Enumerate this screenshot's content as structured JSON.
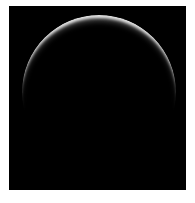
{
  "image": {
    "subject": "crescent-arc",
    "description": "Backlit crescent of a dark sphere against black space",
    "background_color": "#000000",
    "border_color": "#ffffff",
    "arc_color": "#e6e6e6"
  }
}
